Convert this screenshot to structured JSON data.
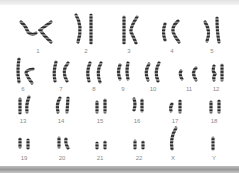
{
  "figure": {
    "band_color": "#2a2a2a",
    "gap_color": "#d8d8d8",
    "label_color": "#8a8a8a"
  },
  "rows": [
    {
      "pairs": [
        {
          "label": "1",
          "x": 38,
          "label_y": 48
        },
        {
          "label": "2",
          "x": 86,
          "label_y": 48
        },
        {
          "label": "3",
          "x": 129,
          "label_y": 48
        },
        {
          "label": "4",
          "x": 172,
          "label_y": 48
        },
        {
          "label": "5",
          "x": 212,
          "label_y": 48
        }
      ]
    },
    {
      "pairs": [
        {
          "label": "6",
          "x": 23,
          "label_y": 86
        },
        {
          "label": "7",
          "x": 61,
          "label_y": 86
        },
        {
          "label": "8",
          "x": 94,
          "label_y": 86
        },
        {
          "label": "9",
          "x": 123,
          "label_y": 86
        },
        {
          "label": "10",
          "x": 153,
          "label_y": 86
        },
        {
          "label": "11",
          "x": 189,
          "label_y": 86
        },
        {
          "label": "12",
          "x": 216,
          "label_y": 86
        }
      ]
    },
    {
      "pairs": [
        {
          "label": "13",
          "x": 23,
          "label_y": 118
        },
        {
          "label": "14",
          "x": 61,
          "label_y": 118
        },
        {
          "label": "15",
          "x": 100,
          "label_y": 118
        },
        {
          "label": "16",
          "x": 137,
          "label_y": 118
        },
        {
          "label": "17",
          "x": 175,
          "label_y": 118
        },
        {
          "label": "18",
          "x": 214,
          "label_y": 118
        }
      ]
    },
    {
      "pairs": [
        {
          "label": "19",
          "x": 24,
          "label_y": 155
        },
        {
          "label": "20",
          "x": 62,
          "label_y": 155
        },
        {
          "label": "21",
          "x": 100,
          "label_y": 155
        },
        {
          "label": "22",
          "x": 139,
          "label_y": 155
        },
        {
          "label": "X",
          "x": 173,
          "label_y": 155
        },
        {
          "label": "Y",
          "x": 214,
          "label_y": 155
        }
      ]
    }
  ]
}
